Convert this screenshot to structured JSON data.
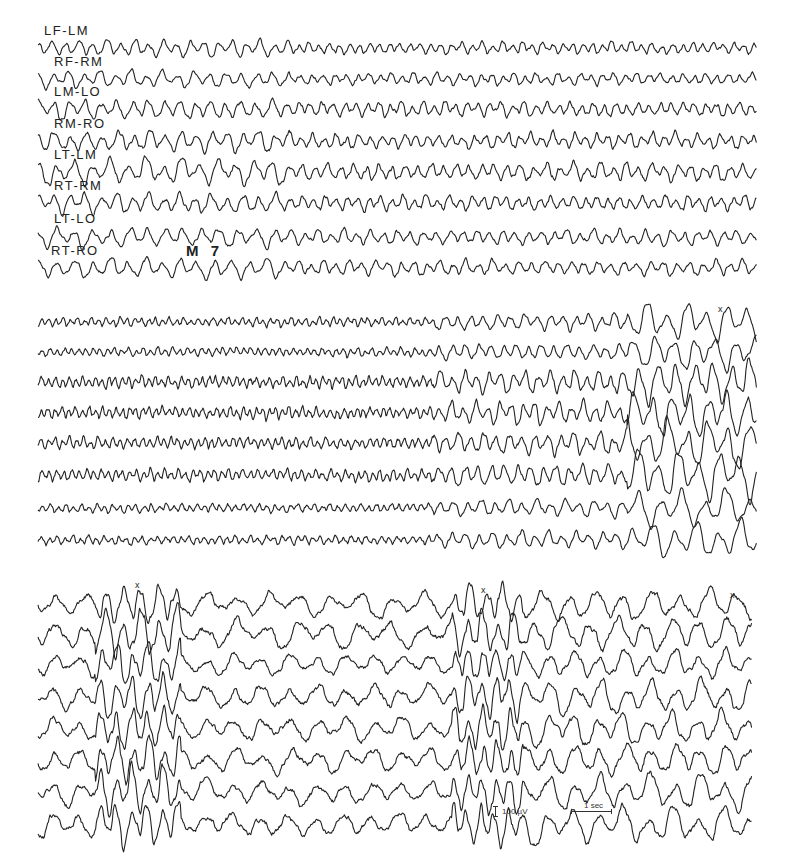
{
  "figure": {
    "marker": "M 7",
    "calibration": {
      "amplitude_label": "100 µV",
      "time_label": "1 sec"
    }
  },
  "chart_data": {
    "type": "line",
    "title": "",
    "subtitle": "Multi-channel EEG recording, three consecutive panels",
    "xlabel": "",
    "ylabel": "",
    "grid": false,
    "legend": "channel labels drawn at left above each trace (panel 1 only)",
    "channels": [
      "LF-LM",
      "RF-RM",
      "LM-LO",
      "RM-RO",
      "LT-LM",
      "RT-RM",
      "LT-LO",
      "RT-RO"
    ],
    "calibration": {
      "amplitude_uV": 100,
      "time_sec": 1
    },
    "annotations": [
      {
        "text": "M 7",
        "panel": 1,
        "near_channel": "RT-RO"
      },
      {
        "text": "x",
        "panel": 2,
        "position": "near end of panel"
      },
      {
        "text": "x",
        "panel": 3,
        "position": "start, ~1.3 s"
      },
      {
        "text": "x",
        "panel": 3,
        "position": "middle"
      },
      {
        "text": "x",
        "panel": 3,
        "position": "end"
      }
    ],
    "panels": [
      {
        "id": 1,
        "description": "Mixed alpha/theta activity, moderate amplitude, larger slow waves early",
        "x_range_px": [
          38,
          757
        ],
        "trace_centers_px": [
          48,
          79,
          109,
          141,
          172,
          203,
          237,
          268
        ],
        "amplitude_px": [
          4,
          4,
          5,
          5,
          6,
          5,
          5,
          5
        ],
        "freq_cycles_per_100px": [
          9,
          8,
          8,
          8,
          7,
          8,
          7,
          7
        ],
        "noise": 0.35,
        "seed": 11,
        "segments": [
          {
            "from": 0.0,
            "to": 0.35,
            "amp_mult": 1.3,
            "freq_mult": 0.8
          },
          {
            "from": 0.35,
            "to": 1.0,
            "amp_mult": 0.9,
            "freq_mult": 1.1
          }
        ]
      },
      {
        "id": 2,
        "description": "Low-voltage fast activity building to high-amplitude slow/sharp discharge at the end",
        "x_range_px": [
          38,
          757
        ],
        "trace_centers_px": [
          322,
          352,
          382,
          413,
          443,
          475,
          508,
          540
        ],
        "amplitude_px": [
          3,
          3,
          4,
          4,
          4,
          4,
          3,
          3
        ],
        "freq_cycles_per_100px": [
          14,
          14,
          15,
          15,
          14,
          14,
          13,
          13
        ],
        "noise": 0.5,
        "seed": 23,
        "segments": [
          {
            "from": 0.0,
            "to": 0.55,
            "amp_mult": 0.9,
            "freq_mult": 1.0
          },
          {
            "from": 0.55,
            "to": 0.82,
            "amp_mult": 1.7,
            "freq_mult": 0.55
          },
          {
            "from": 0.82,
            "to": 1.0,
            "amp_mult": 3.6,
            "freq_mult": 0.35
          }
        ]
      },
      {
        "id": 3,
        "description": "High-amplitude rhythmic slow waves with polyspike bursts near start and middle",
        "x_range_px": [
          38,
          752
        ],
        "trace_centers_px": [
          604,
          634,
          665,
          697,
          728,
          760,
          792,
          825
        ],
        "amplitude_px": [
          9,
          10,
          8,
          9,
          9,
          9,
          9,
          9
        ],
        "freq_cycles_per_100px": [
          3.6,
          3.6,
          4,
          4,
          4,
          4,
          4,
          4
        ],
        "noise": 0.35,
        "seed": 47,
        "segments": [
          {
            "from": 0.0,
            "to": 0.08,
            "amp_mult": 0.8,
            "freq_mult": 1.0
          },
          {
            "from": 0.08,
            "to": 0.2,
            "amp_mult": 1.6,
            "freq_mult": 1.6
          },
          {
            "from": 0.2,
            "to": 0.58,
            "amp_mult": 0.8,
            "freq_mult": 0.9
          },
          {
            "from": 0.58,
            "to": 0.68,
            "amp_mult": 1.4,
            "freq_mult": 1.8
          },
          {
            "from": 0.68,
            "to": 1.0,
            "amp_mult": 1.15,
            "freq_mult": 1.0
          }
        ]
      }
    ]
  },
  "layout": {
    "labels": [
      {
        "text": "LF-LM",
        "x": 44,
        "y": 24
      },
      {
        "text": "RF-RM",
        "x": 54,
        "y": 55
      },
      {
        "text": "LM-LO",
        "x": 54,
        "y": 85
      },
      {
        "text": "RM-RO",
        "x": 54,
        "y": 117
      },
      {
        "text": "LT-LM",
        "x": 54,
        "y": 148
      },
      {
        "text": "RT-RM",
        "x": 54,
        "y": 179
      },
      {
        "text": "LT-LO",
        "x": 54,
        "y": 212
      },
      {
        "text": "RT-RO",
        "x": 51,
        "y": 244
      }
    ],
    "marker_pos": {
      "x": 186,
      "y": 242
    },
    "event_marks": [
      {
        "x": 718,
        "y": 305
      },
      {
        "x": 135,
        "y": 581
      },
      {
        "x": 481,
        "y": 586
      },
      {
        "x": 730,
        "y": 591
      }
    ],
    "calib": {
      "vbar_x": 495,
      "vbar_y1": 806,
      "vbar_y2": 817,
      "text_x": 502,
      "text_y": 808,
      "hbar_x1": 571,
      "hbar_x2": 612,
      "hbar_y": 811,
      "htext_x": 584,
      "htext_y": 802
    }
  }
}
